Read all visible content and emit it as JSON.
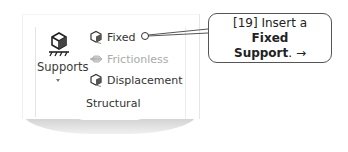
{
  "ribbon": {
    "group_title": "Structural",
    "supports_button": {
      "label": "Supports",
      "icon": "supports-icon",
      "has_dropdown": true
    },
    "items": [
      {
        "label": "Fixed",
        "icon": "fixed-support-icon",
        "enabled": true
      },
      {
        "label": "Frictionless",
        "icon": "frictionless-support-icon",
        "enabled": false
      },
      {
        "label": "Displacement",
        "icon": "displacement-icon",
        "enabled": true
      }
    ]
  },
  "callout": {
    "step": "[19]",
    "text_before": "Insert a",
    "bold_1": "Fixed",
    "bold_2": "Support",
    "text_after": ".",
    "arrow": "→",
    "border_color": "#555555"
  }
}
